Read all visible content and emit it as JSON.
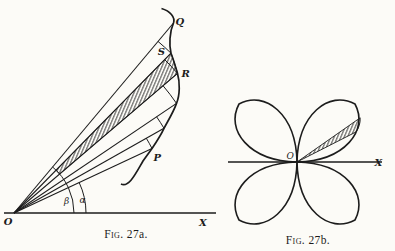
{
  "figure_a": {
    "caption_prefix": "Fig.",
    "caption_number": "27a.",
    "origin_label": "O",
    "axis_label": "X",
    "curve_point_labels": {
      "q": "Q",
      "s": "S",
      "r": "R",
      "p": "P"
    },
    "angle_labels": {
      "beta": "β",
      "alpha": "α"
    }
  },
  "figure_b": {
    "caption_prefix": "Fig.",
    "caption_number": "27b.",
    "origin_label": "O",
    "axis_label": "X"
  },
  "colors": {
    "ink": "#1c1c1c",
    "paper": "#fcfbf7"
  }
}
